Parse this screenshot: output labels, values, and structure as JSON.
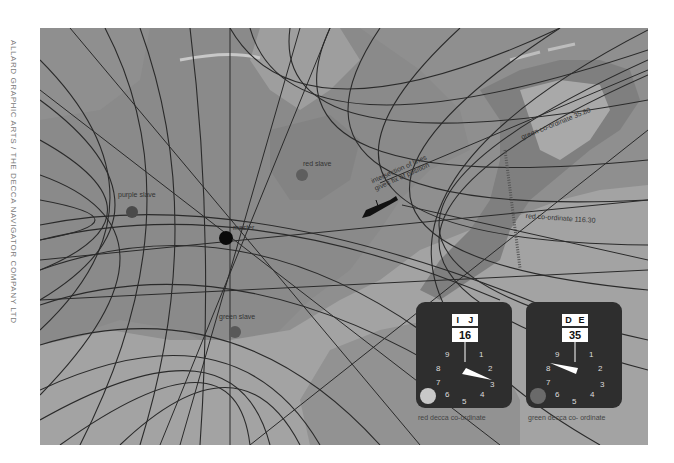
{
  "credit": "ALLARD GRAPHIC ARTS / THE DECCA NAVIGATOR COMPANY LTD",
  "map": {
    "colors": {
      "sea": "#8f8f8f",
      "land": "#a8a8a8",
      "land_dark": "#7d7d7d",
      "lines": "#2a2a2a"
    },
    "stations": [
      {
        "id": "master",
        "label": "master",
        "x": 226,
        "y": 238,
        "color": "#0a0a0a"
      },
      {
        "id": "purple",
        "label": "purple slave",
        "x": 132,
        "y": 212,
        "color": "#4a4a4a"
      },
      {
        "id": "red",
        "label": "red slave",
        "x": 302,
        "y": 175,
        "color": "#5e5e5e"
      },
      {
        "id": "green",
        "label": "green slave",
        "x": 235,
        "y": 332,
        "color": "#585858"
      }
    ],
    "annotations": {
      "fix_line1": "intersection of lines",
      "fix_line2": "gives fix of position",
      "green_coordinate": "green co-ordinate  35.80",
      "red_coordinate": "red co-ordinate  116.30"
    }
  },
  "meters": [
    {
      "id": "red-meter",
      "zone_left": "I",
      "zone_right": "J",
      "lane": "16",
      "caption": "red decca co-ordinate",
      "dial": [
        "9",
        "1",
        "8",
        "2",
        "7",
        "3",
        "6",
        "4",
        "5"
      ],
      "pointer_deg": 115,
      "lamp_color": "#c8c8c8"
    },
    {
      "id": "green-meter",
      "zone_left": "D",
      "zone_right": "E",
      "lane": "35",
      "caption": "green decca co- ordinate",
      "dial": [
        "9",
        "1",
        "8",
        "2",
        "7",
        "3",
        "6",
        "4",
        "5"
      ],
      "pointer_deg": 282,
      "lamp_color": "#6a6a6a"
    }
  ]
}
